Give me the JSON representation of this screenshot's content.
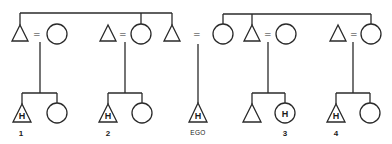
{
  "diagram": {
    "type": "kinship-chart",
    "symbols": {
      "male": "triangle",
      "female": "circle",
      "marriage": "=",
      "marker": "H"
    },
    "generation1": {
      "left_sibling_group": [
        {
          "id": "L1",
          "sex": "male",
          "married_to": "L1w"
        },
        {
          "id": "L2w",
          "sex": "female",
          "married_to": "L2h"
        },
        {
          "id": "L3",
          "sex": "male"
        }
      ],
      "right_sibling_group": [
        {
          "id": "R1",
          "sex": "female",
          "married_to": "EGO_father"
        },
        {
          "id": "R2",
          "sex": "male",
          "married_to": "R2w"
        },
        {
          "id": "R3w",
          "sex": "female",
          "married_to": "R3h"
        }
      ],
      "marriage_sign": "="
    },
    "generation2": {
      "children_groups": [
        {
          "parents": "L1",
          "children": [
            {
              "sex": "male",
              "mark": "H",
              "label": "1"
            },
            {
              "sex": "female",
              "mark": "",
              "label": ""
            }
          ]
        },
        {
          "parents": "L2",
          "children": [
            {
              "sex": "male",
              "mark": "H",
              "label": "2"
            },
            {
              "sex": "female",
              "mark": "",
              "label": ""
            }
          ]
        },
        {
          "parents": "R1",
          "children": [
            {
              "sex": "male",
              "mark": "H",
              "label": "EGO"
            }
          ]
        },
        {
          "parents": "R2",
          "children": [
            {
              "sex": "male",
              "mark": "",
              "label": ""
            },
            {
              "sex": "female",
              "mark": "H",
              "label": "3"
            }
          ]
        },
        {
          "parents": "R3",
          "children": [
            {
              "sex": "male",
              "mark": "H",
              "label": "4"
            },
            {
              "sex": "female",
              "mark": "",
              "label": ""
            }
          ]
        }
      ]
    },
    "labels": {
      "one": "1",
      "two": "2",
      "ego": "EGO",
      "three": "3",
      "four": "4",
      "h": "H",
      "eq": "="
    },
    "colors": {
      "line": "#2a2a2a",
      "background": "#ffffff"
    }
  }
}
